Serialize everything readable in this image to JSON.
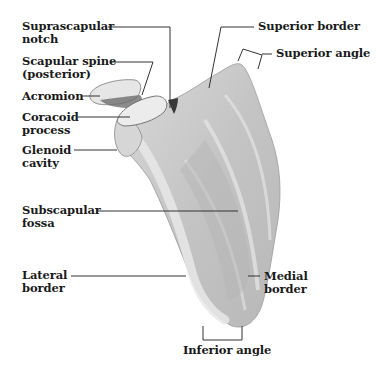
{
  "diagram": {
    "labels": {
      "suprascapular_notch": {
        "line1": "Suprascapular",
        "line2": "notch"
      },
      "scapular_spine": {
        "line1": "Scapular spine",
        "line2": "(posterior)"
      },
      "acromion": {
        "line1": "Acromion"
      },
      "coracoid_process": {
        "line1": "Coracoid",
        "line2": "process"
      },
      "glenoid_cavity": {
        "line1": "Glenoid",
        "line2": "cavity"
      },
      "subscapular_fossa": {
        "line1": "Subscapular",
        "line2": "fossa"
      },
      "lateral_border": {
        "line1": "Lateral",
        "line2": "border"
      },
      "superior_border": {
        "line1": "Superior border"
      },
      "superior_angle": {
        "line1": "Superior angle"
      },
      "medial_border": {
        "line1": "Medial",
        "line2": "border"
      },
      "inferior_angle": {
        "line1": "Inferior angle"
      }
    },
    "colors": {
      "background": "#ffffff",
      "text": "#1a1a1a",
      "leader_line": "#333333",
      "bone_light": "#e6e6e6",
      "bone_mid": "#c8c8c8",
      "bone_dark": "#8a8a8a"
    }
  }
}
